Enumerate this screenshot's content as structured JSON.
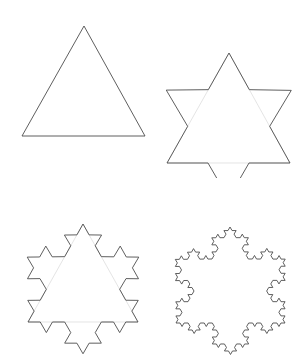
{
  "page": {
    "background_color": "#ffffff",
    "width": 308,
    "height": 357
  },
  "style": {
    "stroke_color": "#4d4d4d",
    "stroke_width": 0.9,
    "ghost_stroke_color": "#d8d8d8",
    "ghost_stroke_width": 0.7,
    "fill": "none"
  },
  "chart_data": {
    "type": "line",
    "xlabel": "",
    "ylabel": "",
    "grid": false,
    "legend": "none",
    "layout": {
      "rows": 2,
      "columns": 2,
      "cell_width": 154,
      "cell_height": 178,
      "order": [
        "iteration-0",
        "iteration-1",
        "iteration-2",
        "iteration-3"
      ]
    },
    "series": [
      {
        "name": "iteration-0",
        "label": "Equilateral triangle",
        "iteration": 0,
        "segments": 3,
        "cell": [
          0,
          0
        ],
        "viewbox": [
          0,
          0,
          154,
          178
        ],
        "base_triangle": {
          "apex": [
            84,
            26
          ],
          "bottom_left": [
            22,
            136
          ],
          "bottom_right": [
            145,
            136
          ]
        },
        "ghost": false
      },
      {
        "name": "iteration-1",
        "label": "Star of David (first iteration)",
        "iteration": 1,
        "segments": 12,
        "cell": [
          0,
          1
        ],
        "viewbox": [
          0,
          0,
          154,
          178
        ],
        "base_triangle": {
          "apex": [
            75,
            53
          ],
          "bottom_left": [
            13,
            163
          ],
          "bottom_right": [
            136,
            163
          ]
        },
        "bounds": {
          "top": 28,
          "bottom": 172,
          "left": 12,
          "right": 138
        },
        "ghost": true
      },
      {
        "name": "iteration-2",
        "label": "Second iteration",
        "iteration": 2,
        "segments": 48,
        "cell": [
          1,
          0
        ],
        "viewbox": [
          0,
          0,
          154,
          178
        ],
        "base_triangle": {
          "apex": [
            83,
            45
          ],
          "bottom_left": [
            28,
            143
          ],
          "bottom_right": [
            138,
            143
          ]
        },
        "bounds": {
          "top": 9,
          "bottom": 157,
          "left": 20,
          "right": 145
        },
        "ghost": true
      },
      {
        "name": "iteration-3",
        "label": "Third iteration",
        "iteration": 3,
        "segments": 192,
        "cell": [
          1,
          1
        ],
        "viewbox": [
          0,
          0,
          154,
          178
        ],
        "base_triangle": {
          "apex": [
            76,
            48
          ],
          "bottom_left": [
            22,
            144
          ],
          "bottom_right": [
            131,
            144
          ]
        },
        "bounds": {
          "top": 11,
          "bottom": 161,
          "left": 12,
          "right": 141
        },
        "ghost": false
      }
    ]
  }
}
